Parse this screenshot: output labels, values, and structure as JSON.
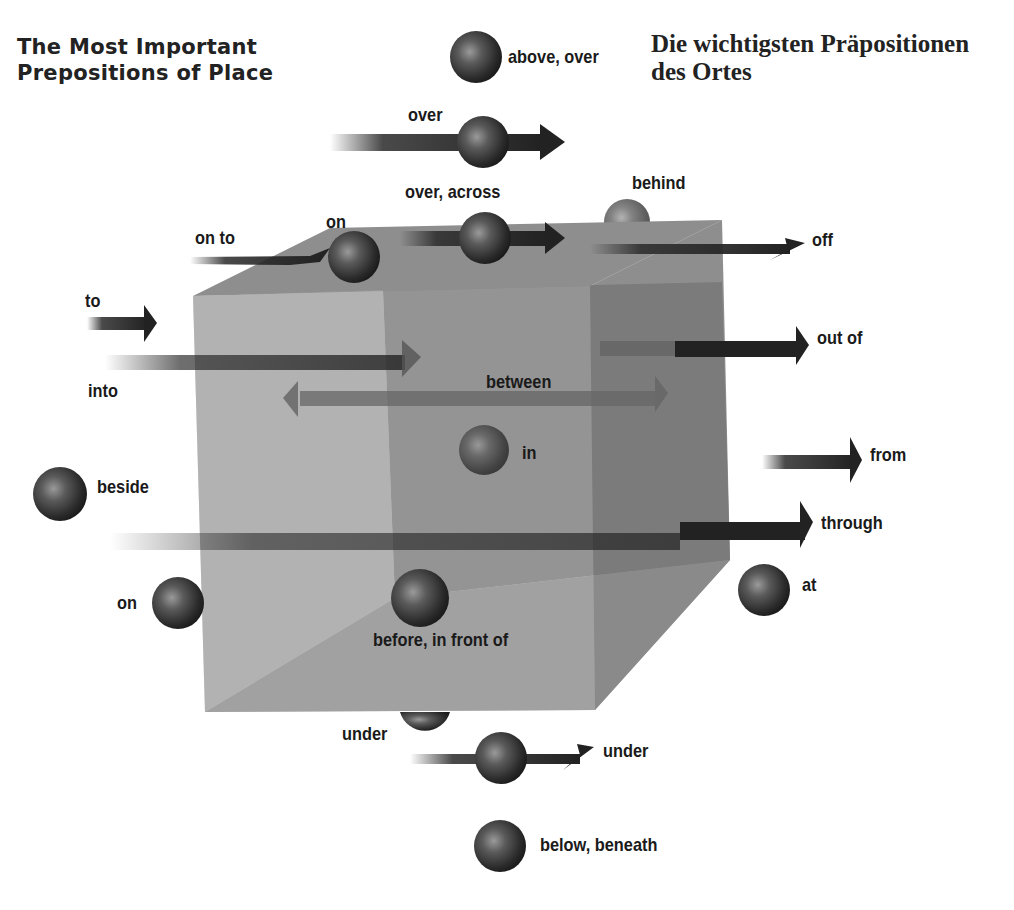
{
  "title_en": {
    "line1": "The Most Important",
    "line2": "Prepositions of Place"
  },
  "title_de": {
    "line1": "Die wichtigsten Präpositionen",
    "line2": "des Ortes"
  },
  "colors": {
    "cube_front": "#9a9a9a",
    "cube_back": "#7c7c7c",
    "cube_top": "#8a8a8a",
    "cube_side": "#7a7a7a",
    "sphere": "#3a3a3a",
    "arrow": "#2a2a2a",
    "text": "#1a1a1a"
  },
  "labels": {
    "above_over": "above, over",
    "over": "over",
    "over_across": "over, across",
    "behind": "behind",
    "on_to": "on to",
    "on_top": "on",
    "off": "off",
    "to": "to",
    "into": "into",
    "out_of": "out of",
    "between": "between",
    "in": "in",
    "from": "from",
    "beside": "beside",
    "through": "through",
    "on_side": "on",
    "at": "at",
    "before": "before, in front of",
    "under_sphere": "under",
    "under_arrow": "under",
    "below": "below, beneath"
  }
}
